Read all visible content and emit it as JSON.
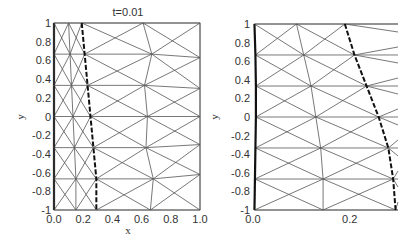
{
  "chart_data": [
    {
      "type": "mesh",
      "title": "t=0.01",
      "xlabel": "x",
      "ylabel": "y",
      "xlim": [
        0,
        1.0
      ],
      "ylim": [
        -1,
        1
      ],
      "xticks": [
        "0.0",
        "0.2",
        "0.4",
        "0.6",
        "0.8",
        "1.0"
      ],
      "yticks": [
        "1",
        "0.8",
        "0.6",
        "0.4",
        "0.2",
        "0",
        "-0.2",
        "-0.4",
        "-0.6",
        "-0.8",
        "-1"
      ],
      "grid": false,
      "frame_px": {
        "left": 54,
        "right": 200,
        "top": 23,
        "bottom": 210
      },
      "node_rows_y": [
        1,
        0.667,
        0.333,
        0,
        -0.333,
        -0.667,
        -1
      ],
      "columns_x": {
        "left_boundary": [
          0,
          0,
          0,
          0,
          0,
          0,
          0
        ],
        "inner": [
          0.1,
          0.11,
          0.12,
          0.13,
          0.14,
          0.15,
          0.15
        ],
        "interface_dashed": [
          0.19,
          0.21,
          0.23,
          0.25,
          0.27,
          0.29,
          0.29
        ],
        "outer_mid": [
          0.61,
          0.67,
          0.62,
          0.64,
          0.63,
          0.68,
          0.66
        ],
        "right_boundary": [
          1,
          1,
          1,
          1,
          1,
          1,
          1
        ]
      },
      "right_boundary_y": [
        1,
        0.63,
        0.3,
        0,
        -0.3,
        -0.62,
        -1
      ]
    },
    {
      "type": "mesh",
      "title": "",
      "xlabel": "",
      "ylabel": "y",
      "xlim": [
        0,
        0.3
      ],
      "ylim": [
        -1,
        1
      ],
      "xticks": [
        "0.0",
        "0.2"
      ],
      "yticks": [
        "1",
        "0.8",
        "0.6",
        "0.4",
        "0.2",
        "0",
        "-0.2",
        "-0.4",
        "-0.6",
        "-0.8",
        "-1"
      ],
      "grid": false,
      "frame_px": {
        "left": 253,
        "right": 398,
        "top": 24,
        "bottom": 210
      },
      "node_rows_y": [
        1,
        0.667,
        0.333,
        0,
        -0.333,
        -0.667,
        -1
      ],
      "columns_x": {
        "left_boundary": [
          0.003,
          0.005,
          0.006,
          0.006,
          0.005,
          0.004,
          0.003
        ],
        "inner": [
          0.09,
          0.105,
          0.12,
          0.13,
          0.14,
          0.145,
          0.145
        ],
        "interface_dashed": [
          0.19,
          0.21,
          0.235,
          0.26,
          0.28,
          0.29,
          0.295
        ]
      }
    }
  ]
}
